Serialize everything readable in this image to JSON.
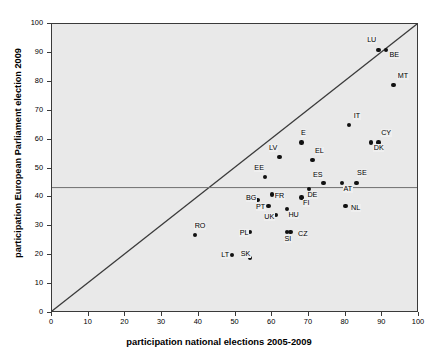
{
  "chart_data": {
    "type": "scatter",
    "title": "",
    "xlabel": "participation national elections 2005-2009",
    "ylabel": "participation European Parliament election 2009",
    "xlim": [
      0,
      100
    ],
    "ylim": [
      0,
      100
    ],
    "xticks": [
      0,
      10,
      20,
      30,
      40,
      50,
      60,
      70,
      80,
      90,
      100
    ],
    "yticks": [
      0,
      10,
      20,
      30,
      40,
      50,
      60,
      70,
      80,
      90,
      100
    ],
    "grid": false,
    "legend": "none",
    "plot_background": "#e9e9e9",
    "marker_color": "#111111",
    "reference_lines": [
      {
        "name": "identity-line",
        "type": "diagonal",
        "from": [
          0,
          0
        ],
        "to": [
          100,
          100
        ],
        "color": "#3a3a3a"
      },
      {
        "name": "eu-average-line",
        "type": "horizontal",
        "y": 43,
        "color": "#6f6f6f"
      }
    ],
    "point_label_field": "code",
    "points": [
      {
        "code": "LU",
        "x": 89,
        "y": 91,
        "label_dx": -12,
        "label_dy": -10
      },
      {
        "code": "BE",
        "x": 91,
        "y": 91,
        "label_dx": 3,
        "label_dy": 5
      },
      {
        "code": "MT",
        "x": 93,
        "y": 79,
        "label_dx": 4,
        "label_dy": -9
      },
      {
        "code": "IT",
        "x": 81,
        "y": 65,
        "label_dx": 4,
        "label_dy": -9
      },
      {
        "code": "CY",
        "x": 89,
        "y": 59,
        "label_dx": 2,
        "label_dy": -9
      },
      {
        "code": "DK",
        "x": 87,
        "y": 59,
        "label_dx": 2,
        "label_dy": 6
      },
      {
        "code": "E",
        "x": 68,
        "y": 59,
        "label_dx": -1,
        "label_dy": -9
      },
      {
        "code": "LV",
        "x": 62,
        "y": 54,
        "label_dx": -11,
        "label_dy": -9
      },
      {
        "code": "EL",
        "x": 71,
        "y": 53,
        "label_dx": 2,
        "label_dy": -9
      },
      {
        "code": "SE",
        "x": 83,
        "y": 45,
        "label_dx": 0,
        "label_dy": -10
      },
      {
        "code": "ES",
        "x": 74,
        "y": 45,
        "label_dx": -11,
        "label_dy": -8
      },
      {
        "code": "AT",
        "x": 79,
        "y": 45,
        "label_dx": 1,
        "label_dy": 6
      },
      {
        "code": "EE",
        "x": 58,
        "y": 47,
        "label_dx": -11,
        "label_dy": -9
      },
      {
        "code": "DE",
        "x": 70,
        "y": 43,
        "label_dx": -2,
        "label_dy": 6
      },
      {
        "code": "BG",
        "x": 56,
        "y": 39,
        "label_dx": -12,
        "label_dy": -2
      },
      {
        "code": "FR",
        "x": 60,
        "y": 41,
        "label_dx": 2,
        "label_dy": 1
      },
      {
        "code": "PT",
        "x": 59,
        "y": 37,
        "label_dx": -13,
        "label_dy": 1
      },
      {
        "code": "FI",
        "x": 68,
        "y": 40,
        "label_dx": 1,
        "label_dy": 6
      },
      {
        "code": "NL",
        "x": 80,
        "y": 37,
        "label_dx": 5,
        "label_dy": 2
      },
      {
        "code": "HU",
        "x": 64,
        "y": 36,
        "label_dx": 1,
        "label_dy": 6
      },
      {
        "code": "UK",
        "x": 61,
        "y": 34,
        "label_dx": -12,
        "label_dy": 2
      },
      {
        "code": "PL",
        "x": 54,
        "y": 28,
        "label_dx": -11,
        "label_dy": 1
      },
      {
        "code": "SI",
        "x": 64,
        "y": 28,
        "label_dx": -3,
        "label_dy": 7
      },
      {
        "code": "CZ",
        "x": 65,
        "y": 28,
        "label_dx": 7,
        "label_dy": 2
      },
      {
        "code": "RO",
        "x": 39,
        "y": 27,
        "label_dx": -1,
        "label_dy": -9
      },
      {
        "code": "LT",
        "x": 49,
        "y": 20,
        "label_dx": -11,
        "label_dy": 0
      },
      {
        "code": "SK",
        "x": 54,
        "y": 19,
        "label_dx": -10,
        "label_dy": -4
      }
    ]
  }
}
